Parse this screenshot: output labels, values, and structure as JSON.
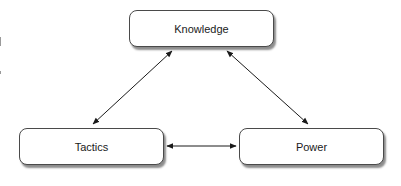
{
  "diagram": {
    "nodes": [
      {
        "id": "knowledge",
        "label": "Knowledge",
        "x": 129,
        "y": 10,
        "w": 145,
        "h": 37
      },
      {
        "id": "tactics",
        "label": "Tactics",
        "x": 19,
        "y": 128,
        "w": 145,
        "h": 37
      },
      {
        "id": "power",
        "label": "Power",
        "x": 239,
        "y": 128,
        "w": 145,
        "h": 37
      }
    ],
    "edges": [
      {
        "from": "knowledge",
        "to": "tactics",
        "type": "bidirectional"
      },
      {
        "from": "knowledge",
        "to": "power",
        "type": "bidirectional"
      },
      {
        "from": "tactics",
        "to": "power",
        "type": "bidirectional"
      }
    ],
    "colors": {
      "stroke": "#1a1a1a",
      "box_border": "#4a4a4a",
      "background": "#ffffff"
    }
  }
}
